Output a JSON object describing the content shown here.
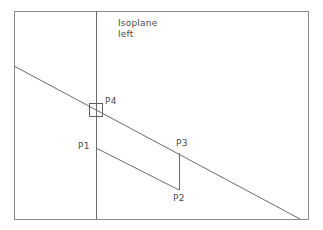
{
  "diagram": {
    "title_annotation": {
      "line1": "Isoplane",
      "line2": "left"
    },
    "canvas": {
      "width": 323,
      "height": 230,
      "background_color": "#ffffff"
    },
    "colors": {
      "frame_stroke": "#8a8a8a",
      "line_stroke": "#6b6b6b",
      "marker_stroke": "#5f5f5f",
      "label_text": "#4a4a4a"
    },
    "frame": {
      "x1": 14,
      "y1": 11,
      "x2": 308,
      "y2": 219
    },
    "vertical_divider": {
      "x": 96,
      "y1": 11,
      "y2": 219
    },
    "main_diagonal": {
      "x1": 14,
      "y1": 66,
      "x2": 300,
      "y2": 219
    },
    "lower_parallel_edge": {
      "x1": 96,
      "y1": 148,
      "x2": 179,
      "y2": 190
    },
    "vertical_connector": {
      "x": 179,
      "y1": 153,
      "y2": 190
    },
    "intersection_marker": {
      "center_x": 96,
      "center_y": 110,
      "size": 14
    },
    "points": [
      {
        "id": "P1",
        "label": "P1",
        "x": 96,
        "y": 148
      },
      {
        "id": "P2",
        "label": "P2",
        "x": 179,
        "y": 190
      },
      {
        "id": "P3",
        "label": "P3",
        "x": 179,
        "y": 153
      },
      {
        "id": "P4",
        "label": "P4",
        "x": 96,
        "y": 110
      }
    ]
  }
}
